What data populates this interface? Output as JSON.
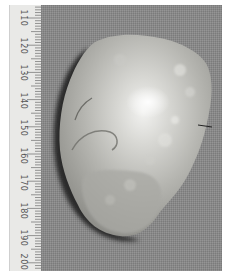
{
  "image": {
    "subject": "gross pathology specimen photograph with ruler",
    "background_color": "#8a8a8a",
    "border_color": "#ffffff"
  },
  "ruler": {
    "units": "mm",
    "labels": [
      "110",
      "120",
      "130",
      "140",
      "150",
      "160",
      "170",
      "180",
      "190",
      "200"
    ]
  }
}
